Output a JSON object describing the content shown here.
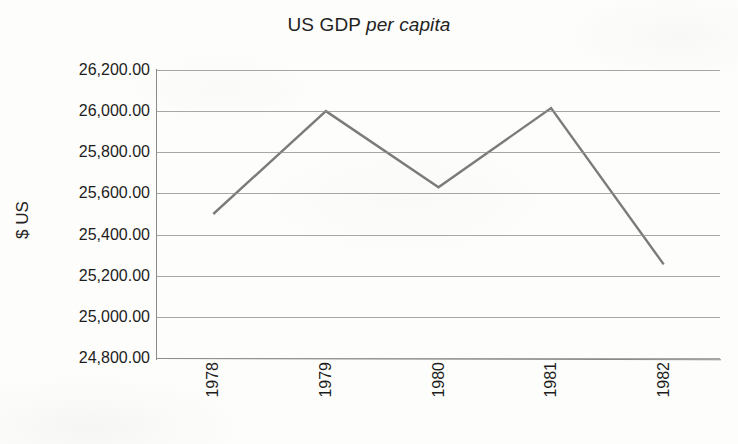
{
  "chart_data": {
    "type": "line",
    "title": "US GDP per capita",
    "title_plain": "US GDP ",
    "title_italic": "per capita",
    "xlabel": "",
    "ylabel": "$ US",
    "categories": [
      "1978",
      "1979",
      "1980",
      "1981",
      "1982"
    ],
    "values": [
      25500.0,
      26000.0,
      25630.0,
      26015.0,
      25255.0
    ],
    "series": [
      {
        "name": "US GDP per capita",
        "values": [
          25500.0,
          26000.0,
          25630.0,
          26015.0,
          25255.0
        ]
      }
    ],
    "ylim": [
      24800.0,
      26200.0
    ],
    "ytick_values": [
      26200.0,
      26000.0,
      25800.0,
      25600.0,
      25400.0,
      25200.0,
      25000.0,
      24800.0
    ],
    "ytick_labels": [
      "26,200.00",
      "26,000.00",
      "25,800.00",
      "25,600.00",
      "25,400.00",
      "25,200.00",
      "25,000.00",
      "24,800.00"
    ],
    "xtick_labels": [
      "1978",
      "1979",
      "1980",
      "1981",
      "1982"
    ],
    "xtick_rotation": 90,
    "grid": "horizontal",
    "legend": "none",
    "markers": "none",
    "line_color": "#7b7b7b",
    "grid_color": "#8e8e8e",
    "axis_color": "#8a8a8a",
    "background_color": "#fdfdfb",
    "text_color": "#1d1d1d"
  }
}
